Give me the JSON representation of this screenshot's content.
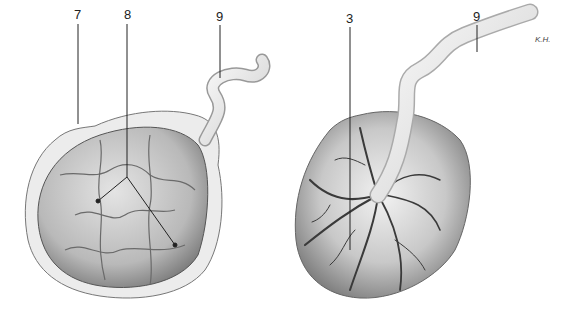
{
  "figure": {
    "left_panel": {
      "name": "maternal-surface",
      "labels": [
        {
          "id": "7",
          "text": "7",
          "x": 74,
          "y": 8
        },
        {
          "id": "8",
          "text": "8",
          "x": 124,
          "y": 8
        },
        {
          "id": "9",
          "text": "9",
          "x": 216,
          "y": 10
        }
      ]
    },
    "right_panel": {
      "name": "fetal-surface",
      "labels": [
        {
          "id": "3",
          "text": "3",
          "x": 346,
          "y": 12
        },
        {
          "id": "9",
          "text": "9",
          "x": 473,
          "y": 10
        }
      ],
      "annotation": "K.H."
    },
    "colors": {
      "ink": "#222222",
      "tissue_light": "#e6e6e6",
      "tissue_mid": "#a8a8a8",
      "tissue_dark": "#555555",
      "vessel": "#3a3a3a"
    }
  }
}
